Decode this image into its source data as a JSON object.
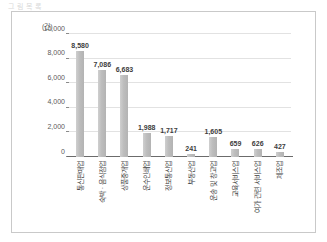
{
  "caption": "그 림  목 록",
  "chart_data": {
    "type": "bar",
    "title": "",
    "subtitle": "",
    "xlabel": "",
    "ylabel": "",
    "unit_label": "(건)",
    "ylim": [
      0,
      10000
    ],
    "ytick_values": [
      0,
      2000,
      4000,
      6000,
      8000,
      10000
    ],
    "ytick_labels": [
      "0",
      "2,000",
      "4,000",
      "6,000",
      "8,000",
      "10,000"
    ],
    "grid": true,
    "legend": "none",
    "bar_color": "#bdbdbd",
    "categories": [
      "통신판매업",
      "숙박 · 음식점업",
      "상품중개업",
      "운수인쇄업",
      "정보통신업",
      "부동산업",
      "운송 및 창고업",
      "교육서비스업",
      "여가 관련 서비스업",
      "제조업"
    ],
    "values": [
      8580,
      7086,
      6683,
      1988,
      1717,
      241,
      1605,
      659,
      626,
      427
    ],
    "value_labels": [
      "8,580",
      "7,086",
      "6,683",
      "1,988",
      "1,717",
      "241",
      "1,605",
      "659",
      "626",
      "427"
    ]
  }
}
